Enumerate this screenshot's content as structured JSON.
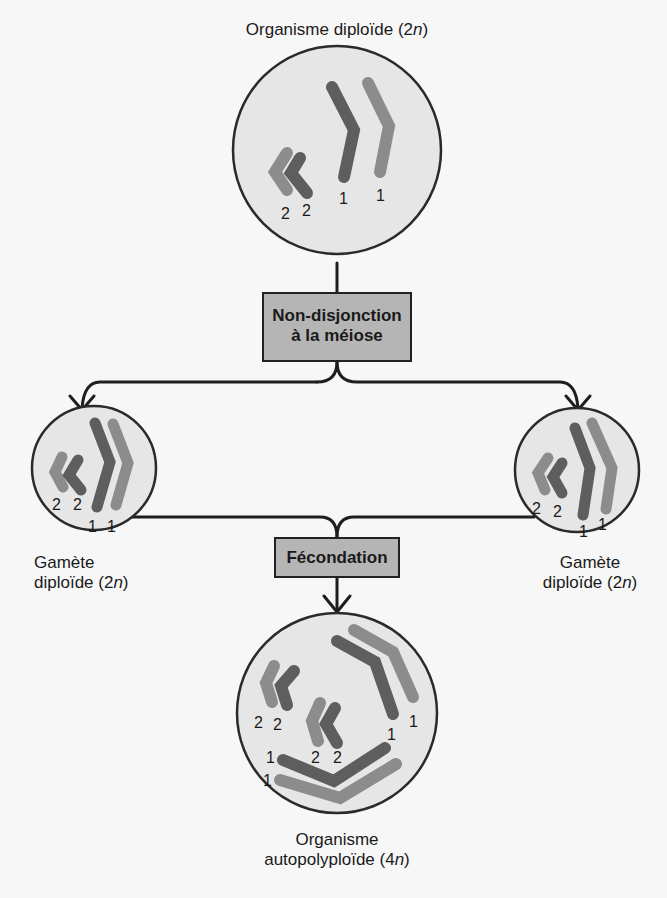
{
  "title_top": {
    "text": "Organisme diploïde (2",
    "italic": "n",
    "close": ")"
  },
  "process_1": {
    "line1": "Non-disjonction",
    "line2": "à la méiose"
  },
  "gamete_left": {
    "line1": "Gamète",
    "line2_text": "diploïde (2",
    "italic": "n",
    "close": ")"
  },
  "gamete_right": {
    "line1": "Gamète",
    "line2_text": "diploïde (2",
    "italic": "n",
    "close": ")"
  },
  "process_2": {
    "label": "Fécondation"
  },
  "bottom_label": {
    "line1": "Organisme",
    "line2_text": "autopolyploïde (4",
    "italic": "n",
    "close": ")"
  },
  "chromosome_labels": {
    "top_cell": [
      "2",
      "2",
      "1",
      "1"
    ],
    "left_gamete": [
      "2",
      "2",
      "1",
      "1"
    ],
    "right_gamete": [
      "2",
      "2",
      "1",
      "1"
    ],
    "bottom_cell": [
      "2",
      "2",
      "2",
      "2",
      "1",
      "1",
      "1",
      "1"
    ]
  },
  "colors": {
    "cell_fill": "#e6e6e6",
    "outline": "#2a2a2a",
    "chromosome_dark": "#5e5e5e",
    "chromosome_light": "#8c8c8c",
    "box_fill": "#b5b5b5"
  }
}
